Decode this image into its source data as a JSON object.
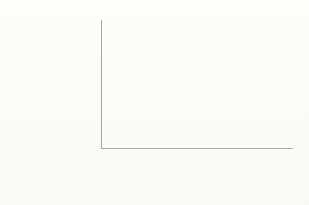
{
  "chart_data": {
    "type": "bar",
    "title": "",
    "subtitle": "",
    "xlabel": "",
    "ylabel": "Negotiation probability",
    "ylabel_lines": [
      "Negotiation",
      "probability"
    ],
    "ylim": [
      0,
      0.25
    ],
    "grid": false,
    "legend": "none",
    "y_ticks": [
      "0",
      "0.05",
      "0.10",
      "0.15",
      "0.20",
      "0.25"
    ],
    "y_tick_values": [
      0,
      0.05,
      0.1,
      0.15,
      0.2,
      0.25
    ],
    "categories": [
      "Men",
      "Women",
      "Men",
      "Women"
    ],
    "values": [
      0.107,
      0.085,
      0.222,
      0.242
    ],
    "groups": [
      {
        "label_lines": [
          "Wage not explicitly",
          "negotiable"
        ],
        "label": "Wage not explicitly negotiable",
        "bars": [
          {
            "category": "Men",
            "value": 0.107,
            "color": "#898989"
          },
          {
            "category": "Women",
            "value": 0.085,
            "color": "#999999"
          }
        ]
      },
      {
        "label_lines": [
          "Wage explicitly",
          "negotiable"
        ],
        "label": "Wage explicitly negotiable",
        "bars": [
          {
            "category": "Men",
            "value": 0.222,
            "color": "#898989"
          },
          {
            "category": "Women",
            "value": 0.242,
            "color": "#9d9d9d"
          }
        ]
      }
    ]
  },
  "colors": {
    "background": "#fdfdfc",
    "axis": "#a8a8a8",
    "text": "#262626",
    "bar_men": "#898989",
    "bar_women": "#9b9b9b"
  }
}
